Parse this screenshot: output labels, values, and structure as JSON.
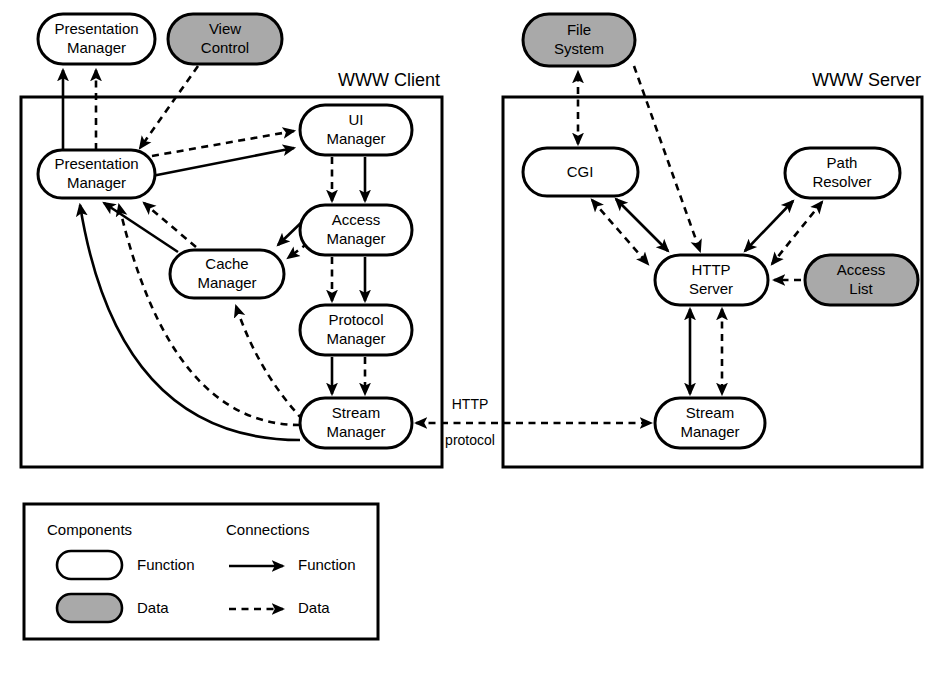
{
  "diagram": {
    "containers": [
      {
        "id": "client",
        "label": "WWW Client",
        "x": 21,
        "y": 97,
        "w": 421,
        "h": 370
      },
      {
        "id": "server",
        "label": "WWW Server",
        "x": 503,
        "y": 97,
        "w": 419,
        "h": 370
      }
    ],
    "nodes": [
      {
        "id": "pm-ext",
        "label_line1": "Presentation",
        "label_line2": "Manager",
        "kind": "Function",
        "x": 38,
        "y": 14,
        "w": 117,
        "h": 50
      },
      {
        "id": "viewctl",
        "label_line1": "View",
        "label_line2": "Control",
        "kind": "Data",
        "x": 168,
        "y": 14,
        "w": 114,
        "h": 50
      },
      {
        "id": "pm-in",
        "label_line1": "Presentation",
        "label_line2": "Manager",
        "kind": "Function",
        "x": 38,
        "y": 150,
        "w": 117,
        "h": 48
      },
      {
        "id": "uimgr",
        "label_line1": "UI",
        "label_line2": "Manager",
        "kind": "Function",
        "x": 300,
        "y": 105,
        "w": 112,
        "h": 50
      },
      {
        "id": "accessmgr",
        "label_line1": "Access",
        "label_line2": "Manager",
        "kind": "Function",
        "x": 300,
        "y": 205,
        "w": 112,
        "h": 50
      },
      {
        "id": "cachemgr",
        "label_line1": "Cache",
        "label_line2": "Manager",
        "kind": "Function",
        "x": 170,
        "y": 250,
        "w": 114,
        "h": 48
      },
      {
        "id": "protomgr",
        "label_line1": "Protocol",
        "label_line2": "Manager",
        "kind": "Function",
        "x": 300,
        "y": 305,
        "w": 112,
        "h": 50
      },
      {
        "id": "streamc",
        "label_line1": "Stream",
        "label_line2": "Manager",
        "kind": "Function",
        "x": 300,
        "y": 398,
        "w": 112,
        "h": 50
      },
      {
        "id": "filesys",
        "label_line1": "File",
        "label_line2": "System",
        "kind": "Data",
        "x": 523,
        "y": 14,
        "w": 112,
        "h": 52
      },
      {
        "id": "cgi",
        "label_line1": "CGI",
        "label_line2": "",
        "kind": "Function",
        "x": 523,
        "y": 148,
        "w": 115,
        "h": 48
      },
      {
        "id": "pathres",
        "label_line1": "Path",
        "label_line2": "Resolver",
        "kind": "Function",
        "x": 785,
        "y": 148,
        "w": 115,
        "h": 50
      },
      {
        "id": "httpsrv",
        "label_line1": "HTTP",
        "label_line2": "Server",
        "kind": "Function",
        "x": 655,
        "y": 255,
        "w": 113,
        "h": 50
      },
      {
        "id": "acclist",
        "label_line1": "Access",
        "label_line2": "List",
        "kind": "Data",
        "x": 805,
        "y": 255,
        "w": 113,
        "h": 50
      },
      {
        "id": "streams",
        "label_line1": "Stream",
        "label_line2": "Manager",
        "kind": "Function",
        "x": 655,
        "y": 398,
        "w": 110,
        "h": 50
      }
    ],
    "edge_labels": [
      {
        "id": "http-protocol",
        "line1": "HTTP",
        "line2": "protocol",
        "x": 470,
        "y": 410
      }
    ]
  },
  "legend": {
    "box": {
      "x": 24,
      "y": 504,
      "w": 354,
      "h": 135
    },
    "heading_components": "Components",
    "heading_connections": "Connections",
    "items": [
      {
        "id": "legend-function-shape",
        "label": "Function",
        "kind": "shape",
        "fill": "#ffffff"
      },
      {
        "id": "legend-data-shape",
        "label": "Data",
        "kind": "shape",
        "fill": "#a9a9a9"
      },
      {
        "id": "legend-function-arrow",
        "label": "Function",
        "kind": "arrow",
        "style": "solid"
      },
      {
        "id": "legend-data-arrow",
        "label": "Data",
        "kind": "arrow",
        "style": "dashed"
      }
    ]
  },
  "colors": {
    "stroke": "#000000",
    "function_fill": "#ffffff",
    "data_fill": "#a9a9a9",
    "background": "#ffffff"
  }
}
